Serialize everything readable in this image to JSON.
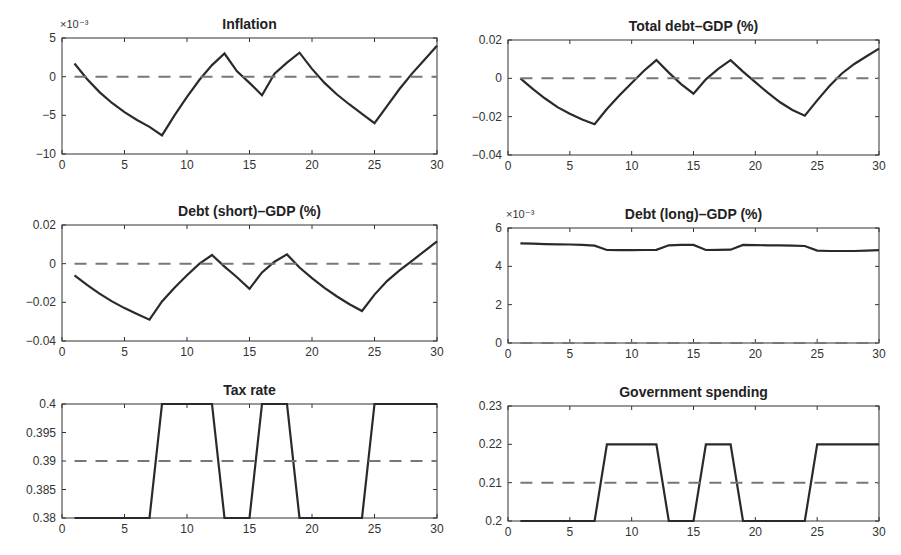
{
  "chart_data": [
    {
      "type": "line",
      "title": "Inflation",
      "exponent_label": "×10⁻³",
      "x": [
        1,
        2,
        3,
        4,
        5,
        6,
        7,
        8,
        9,
        10,
        11,
        12,
        13,
        14,
        15,
        16,
        17,
        18,
        19,
        20,
        21,
        22,
        23,
        24,
        25,
        26,
        27,
        28,
        29,
        30
      ],
      "series": [
        {
          "name": "response",
          "style": "solid",
          "values": [
            1.7,
            -0.3,
            -2.0,
            -3.4,
            -4.6,
            -5.6,
            -6.5,
            -7.6,
            -5.0,
            -2.6,
            -0.4,
            1.5,
            3.0,
            0.7,
            -0.8,
            -2.4,
            0.4,
            1.8,
            3.1,
            1.0,
            -0.8,
            -2.3,
            -3.6,
            -4.8,
            -6.0,
            -3.8,
            -1.6,
            0.4,
            2.2,
            4.0
          ]
        },
        {
          "name": "baseline",
          "style": "dashed",
          "values": [
            0,
            0,
            0,
            0,
            0,
            0,
            0,
            0,
            0,
            0,
            0,
            0,
            0,
            0,
            0,
            0,
            0,
            0,
            0,
            0,
            0,
            0,
            0,
            0,
            0,
            0,
            0,
            0,
            0,
            0
          ]
        }
      ],
      "xlim": [
        0,
        30
      ],
      "ylim": [
        -10,
        5
      ],
      "xticks": [
        0,
        5,
        10,
        15,
        20,
        25,
        30
      ],
      "yticks": [
        -10,
        -5,
        0,
        5
      ],
      "ytick_labels": [
        "−10",
        "−5",
        "0",
        "5"
      ],
      "xlabel": "",
      "ylabel": "",
      "grid": false
    },
    {
      "type": "line",
      "title": "Total debt–GDP (%)",
      "exponent_label": "",
      "x": [
        1,
        2,
        3,
        4,
        5,
        6,
        7,
        8,
        9,
        10,
        11,
        12,
        13,
        14,
        15,
        16,
        17,
        18,
        19,
        20,
        21,
        22,
        23,
        24,
        25,
        26,
        27,
        28,
        29,
        30
      ],
      "series": [
        {
          "name": "response",
          "style": "solid",
          "values": [
            0.0,
            -0.0055,
            -0.0105,
            -0.015,
            -0.0185,
            -0.0215,
            -0.024,
            -0.016,
            -0.009,
            -0.0025,
            0.004,
            0.0095,
            0.003,
            -0.003,
            -0.008,
            -0.0005,
            0.005,
            0.0095,
            0.0035,
            -0.002,
            -0.0075,
            -0.0125,
            -0.0165,
            -0.0195,
            -0.0115,
            -0.004,
            0.0025,
            0.0075,
            0.0115,
            0.0155
          ]
        },
        {
          "name": "baseline",
          "style": "dashed",
          "values": [
            0,
            0,
            0,
            0,
            0,
            0,
            0,
            0,
            0,
            0,
            0,
            0,
            0,
            0,
            0,
            0,
            0,
            0,
            0,
            0,
            0,
            0,
            0,
            0,
            0,
            0,
            0,
            0,
            0,
            0
          ]
        }
      ],
      "xlim": [
        0,
        30
      ],
      "ylim": [
        -0.04,
        0.02
      ],
      "xticks": [
        0,
        5,
        10,
        15,
        20,
        25,
        30
      ],
      "yticks": [
        -0.04,
        -0.02,
        0,
        0.02
      ],
      "ytick_labels": [
        "−0.04",
        "−0.02",
        "0",
        "0.02"
      ],
      "xlabel": "",
      "ylabel": "",
      "grid": false
    },
    {
      "type": "line",
      "title": "Debt (short)–GDP (%)",
      "exponent_label": "",
      "x": [
        1,
        2,
        3,
        4,
        5,
        6,
        7,
        8,
        9,
        10,
        11,
        12,
        13,
        14,
        15,
        16,
        17,
        18,
        19,
        20,
        21,
        22,
        23,
        24,
        25,
        26,
        27,
        28,
        29,
        30
      ],
      "series": [
        {
          "name": "response",
          "style": "solid",
          "values": [
            -0.006,
            -0.011,
            -0.0155,
            -0.0195,
            -0.023,
            -0.026,
            -0.029,
            -0.0195,
            -0.0125,
            -0.006,
            0.0,
            0.0045,
            -0.0015,
            -0.007,
            -0.013,
            -0.0045,
            0.001,
            0.0048,
            -0.002,
            -0.0075,
            -0.0125,
            -0.017,
            -0.021,
            -0.0245,
            -0.016,
            -0.009,
            -0.0035,
            0.0015,
            0.0065,
            0.0115
          ]
        },
        {
          "name": "baseline",
          "style": "dashed",
          "values": [
            0,
            0,
            0,
            0,
            0,
            0,
            0,
            0,
            0,
            0,
            0,
            0,
            0,
            0,
            0,
            0,
            0,
            0,
            0,
            0,
            0,
            0,
            0,
            0,
            0,
            0,
            0,
            0,
            0,
            0
          ]
        }
      ],
      "xlim": [
        0,
        30
      ],
      "ylim": [
        -0.04,
        0.02
      ],
      "xticks": [
        0,
        5,
        10,
        15,
        20,
        25,
        30
      ],
      "yticks": [
        -0.04,
        -0.02,
        0,
        0.02
      ],
      "ytick_labels": [
        "−0.04",
        "−0.02",
        "0",
        "0.02"
      ],
      "xlabel": "",
      "ylabel": "",
      "grid": false
    },
    {
      "type": "line",
      "title": "Debt (long)–GDP (%)",
      "exponent_label": "×10⁻³",
      "x": [
        1,
        2,
        3,
        4,
        5,
        6,
        7,
        8,
        9,
        10,
        11,
        12,
        13,
        14,
        15,
        16,
        17,
        18,
        19,
        20,
        21,
        22,
        23,
        24,
        25,
        26,
        27,
        28,
        29,
        30
      ],
      "series": [
        {
          "name": "response",
          "style": "solid",
          "values": [
            5.2,
            5.18,
            5.16,
            5.15,
            5.14,
            5.12,
            5.08,
            4.85,
            4.84,
            4.84,
            4.85,
            4.86,
            5.1,
            5.12,
            5.12,
            4.85,
            4.86,
            4.87,
            5.12,
            5.11,
            5.1,
            5.09,
            5.08,
            5.06,
            4.82,
            4.8,
            4.8,
            4.8,
            4.82,
            4.84
          ]
        },
        {
          "name": "baseline",
          "style": "dashed",
          "values": [
            0,
            0,
            0,
            0,
            0,
            0,
            0,
            0,
            0,
            0,
            0,
            0,
            0,
            0,
            0,
            0,
            0,
            0,
            0,
            0,
            0,
            0,
            0,
            0,
            0,
            0,
            0,
            0,
            0,
            0
          ]
        }
      ],
      "xlim": [
        0,
        30
      ],
      "ylim": [
        0,
        6
      ],
      "xticks": [
        0,
        5,
        10,
        15,
        20,
        25,
        30
      ],
      "yticks": [
        0,
        2,
        4,
        6
      ],
      "ytick_labels": [
        "0",
        "2",
        "4",
        "6"
      ],
      "xlabel": "",
      "ylabel": "",
      "grid": false
    },
    {
      "type": "line",
      "title": "Tax rate",
      "exponent_label": "",
      "x": [
        1,
        2,
        3,
        4,
        5,
        6,
        7,
        8,
        9,
        10,
        11,
        12,
        13,
        14,
        15,
        16,
        17,
        18,
        19,
        20,
        21,
        22,
        23,
        24,
        25,
        26,
        27,
        28,
        29,
        30
      ],
      "series": [
        {
          "name": "response",
          "style": "solid",
          "values": [
            0.38,
            0.38,
            0.38,
            0.38,
            0.38,
            0.38,
            0.38,
            0.4,
            0.4,
            0.4,
            0.4,
            0.4,
            0.38,
            0.38,
            0.38,
            0.4,
            0.4,
            0.4,
            0.38,
            0.38,
            0.38,
            0.38,
            0.38,
            0.38,
            0.4,
            0.4,
            0.4,
            0.4,
            0.4,
            0.4
          ]
        },
        {
          "name": "baseline",
          "style": "dashed",
          "values": [
            0.39,
            0.39,
            0.39,
            0.39,
            0.39,
            0.39,
            0.39,
            0.39,
            0.39,
            0.39,
            0.39,
            0.39,
            0.39,
            0.39,
            0.39,
            0.39,
            0.39,
            0.39,
            0.39,
            0.39,
            0.39,
            0.39,
            0.39,
            0.39,
            0.39,
            0.39,
            0.39,
            0.39,
            0.39,
            0.39
          ]
        }
      ],
      "xlim": [
        0,
        30
      ],
      "ylim": [
        0.38,
        0.4
      ],
      "xticks": [
        0,
        5,
        10,
        15,
        20,
        25,
        30
      ],
      "yticks": [
        0.38,
        0.385,
        0.39,
        0.395,
        0.4
      ],
      "ytick_labels": [
        "0.38",
        "0.385",
        "0.39",
        "0.395",
        "0.4"
      ],
      "xlabel": "",
      "ylabel": "",
      "grid": false
    },
    {
      "type": "line",
      "title": "Government spending",
      "exponent_label": "",
      "x": [
        1,
        2,
        3,
        4,
        5,
        6,
        7,
        8,
        9,
        10,
        11,
        12,
        13,
        14,
        15,
        16,
        17,
        18,
        19,
        20,
        21,
        22,
        23,
        24,
        25,
        26,
        27,
        28,
        29,
        30
      ],
      "series": [
        {
          "name": "response",
          "style": "solid",
          "values": [
            0.2,
            0.2,
            0.2,
            0.2,
            0.2,
            0.2,
            0.2,
            0.22,
            0.22,
            0.22,
            0.22,
            0.22,
            0.2,
            0.2,
            0.2,
            0.22,
            0.22,
            0.22,
            0.2,
            0.2,
            0.2,
            0.2,
            0.2,
            0.2,
            0.22,
            0.22,
            0.22,
            0.22,
            0.22,
            0.22
          ]
        },
        {
          "name": "baseline",
          "style": "dashed",
          "values": [
            0.21,
            0.21,
            0.21,
            0.21,
            0.21,
            0.21,
            0.21,
            0.21,
            0.21,
            0.21,
            0.21,
            0.21,
            0.21,
            0.21,
            0.21,
            0.21,
            0.21,
            0.21,
            0.21,
            0.21,
            0.21,
            0.21,
            0.21,
            0.21,
            0.21,
            0.21,
            0.21,
            0.21,
            0.21,
            0.21
          ]
        }
      ],
      "xlim": [
        0,
        30
      ],
      "ylim": [
        0.2,
        0.23
      ],
      "xticks": [
        0,
        5,
        10,
        15,
        20,
        25,
        30
      ],
      "yticks": [
        0.2,
        0.21,
        0.22,
        0.23
      ],
      "ytick_labels": [
        "0.2",
        "0.21",
        "0.22",
        "0.23"
      ],
      "xlabel": "",
      "ylabel": "",
      "grid": false
    }
  ],
  "layout": {
    "panels": [
      {
        "left": 62,
        "top": 38,
        "right": 437,
        "bottom": 154
      },
      {
        "left": 508,
        "top": 40,
        "right": 879,
        "bottom": 155
      },
      {
        "left": 62,
        "top": 225,
        "right": 437,
        "bottom": 341
      },
      {
        "left": 508,
        "top": 228,
        "right": 879,
        "bottom": 343
      },
      {
        "left": 62,
        "top": 404,
        "right": 437,
        "bottom": 518
      },
      {
        "left": 508,
        "top": 406,
        "right": 879,
        "bottom": 521
      }
    ]
  }
}
